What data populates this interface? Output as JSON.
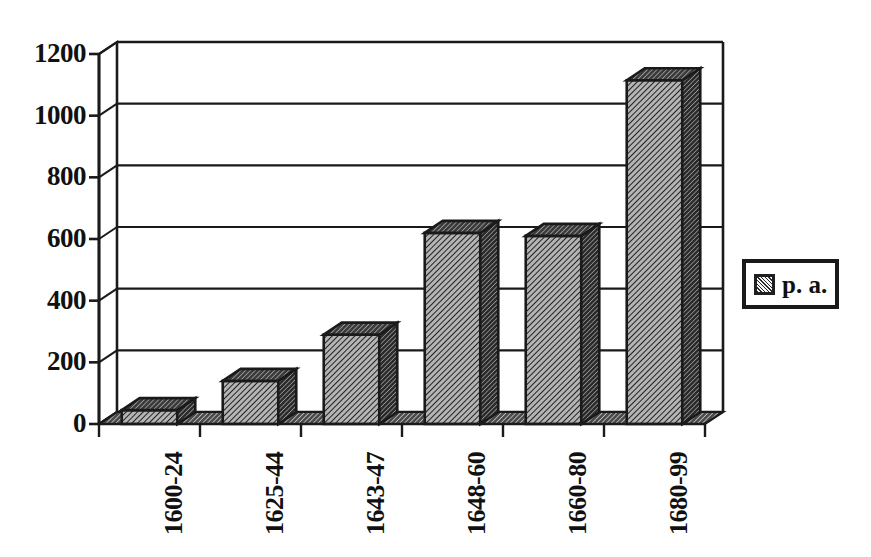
{
  "chart_data": {
    "type": "bar",
    "title": "",
    "subtitle": "",
    "xlabel": "",
    "ylabel": "",
    "categories": [
      "1600-24",
      "1625-44",
      "1643-47",
      "1648-60",
      "1660-80",
      "1680-99"
    ],
    "series": [
      {
        "name": "p. a.",
        "values": [
          45,
          140,
          290,
          620,
          610,
          1115
        ]
      }
    ],
    "values": [
      45,
      140,
      290,
      620,
      610,
      1115
    ],
    "ylim": [
      0,
      1200
    ],
    "ytick_labels": [
      "0",
      "200",
      "400",
      "600",
      "800",
      "1000",
      "1200"
    ],
    "ytick_values": [
      0,
      200,
      400,
      600,
      800,
      1000,
      1200
    ],
    "grid": true,
    "grid_axis": "y",
    "legend": {
      "position": "right",
      "entries": [
        {
          "label": "p. a.",
          "swatch": "hatched-gray"
        }
      ]
    },
    "style": "3d-bar",
    "colors": {
      "bar_face": "#9a9a9a",
      "bar_side": "#3a3a3a",
      "bar_top": "#4a4a4a",
      "axis": "#1a1a1a",
      "grid": "#1a1a1a",
      "background": "#ffffff",
      "text": "#111111"
    }
  },
  "legend_box": {
    "label": "p. a."
  },
  "axes": {
    "y_labels": [
      "1200",
      "1000",
      "800",
      "600",
      "400",
      "200",
      "0"
    ],
    "x_labels": [
      "1600-24",
      "1625-44",
      "1643-47",
      "1648-60",
      "1660-80",
      "1680-99"
    ]
  }
}
